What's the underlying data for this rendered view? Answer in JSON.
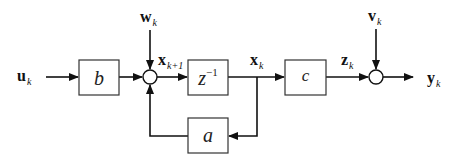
{
  "diagram": {
    "type": "block-diagram",
    "signals": {
      "input": {
        "symbol": "u",
        "subscript": "k"
      },
      "process_noise": {
        "symbol": "w",
        "subscript": "k"
      },
      "next_state": {
        "symbol": "x",
        "subscript": "k+1"
      },
      "state": {
        "symbol": "x",
        "subscript": "k"
      },
      "clean_output": {
        "symbol": "z",
        "subscript": "k"
      },
      "measurement_noise": {
        "symbol": "v",
        "subscript": "k"
      },
      "output": {
        "symbol": "y",
        "subscript": "k"
      }
    },
    "blocks": {
      "input_gain": "b",
      "delay": "z",
      "delay_exponent": "−1",
      "output_gain": "c",
      "feedback_gain": "a"
    },
    "summing_junctions": 2,
    "colors": {
      "line": "#111111",
      "box_fill": "#ffffff",
      "background": "#ffffff"
    }
  }
}
